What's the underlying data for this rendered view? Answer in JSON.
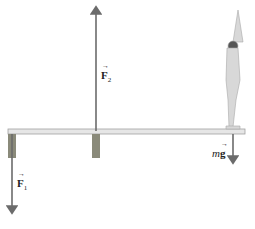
{
  "diagram": {
    "type": "free-body diagram of diving board",
    "labels": {
      "f1": {
        "symbol": "F",
        "subscript": "1"
      },
      "f2": {
        "symbol": "F",
        "subscript": "2"
      },
      "mg": {
        "prefix": "m",
        "symbol": "g"
      }
    },
    "colors": {
      "arrow": "#6b6b6b",
      "board": "#e6e6e6",
      "board_edge": "#9a9a9a",
      "support": "#8a8a7a",
      "figure": "#d9d9d9"
    }
  }
}
